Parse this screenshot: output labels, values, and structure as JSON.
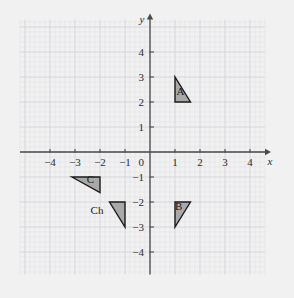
{
  "figure": {
    "type": "coordinate-plane",
    "background_color": "#f1f1f1",
    "grid_color_minor": "#e3e3e8",
    "grid_color_major": "#d2d2da",
    "axis_color": "#4a4a4a",
    "shape_fill": "#a9a9a9",
    "shape_stroke": "#1c1c1c"
  },
  "axes": {
    "x_axis_name": "x",
    "y_axis_name": "y",
    "origin_label": "0",
    "x_ticks": [
      {
        "value": -4,
        "label": "−4"
      },
      {
        "value": -3,
        "label": "−3"
      },
      {
        "value": -2,
        "label": "−2"
      },
      {
        "value": -1,
        "label": "−1"
      },
      {
        "value": 1,
        "label": "1"
      },
      {
        "value": 2,
        "label": "2"
      },
      {
        "value": 3,
        "label": "3"
      },
      {
        "value": 4,
        "label": "4"
      }
    ],
    "y_ticks": [
      {
        "value": 4,
        "label": "4"
      },
      {
        "value": 3,
        "label": "3"
      },
      {
        "value": 2,
        "label": "2"
      },
      {
        "value": 1,
        "label": "1"
      },
      {
        "value": -1,
        "label": "−1"
      },
      {
        "value": -2,
        "label": "−2"
      },
      {
        "value": -3,
        "label": "−3"
      },
      {
        "value": -4,
        "label": "−4"
      }
    ],
    "x_range": [
      -5.2,
      4.6
    ],
    "y_range": [
      -4.9,
      5.3
    ],
    "minor_grid_per_unit": 5
  },
  "shapes": [
    {
      "id": "triangle-a",
      "label": "A",
      "label_position": {
        "x": 1.22,
        "y": 2.28
      },
      "vertices": [
        [
          1,
          3
        ],
        [
          1,
          2
        ],
        [
          1.62,
          2
        ]
      ]
    },
    {
      "id": "triangle-b",
      "label": "B",
      "label_position": {
        "x": 1.15,
        "y": -2.3
      },
      "vertices": [
        [
          1,
          -2
        ],
        [
          1.62,
          -2
        ],
        [
          1,
          -3
        ]
      ]
    },
    {
      "id": "triangle-c",
      "label": "C",
      "label_position": {
        "x": -2.38,
        "y": -1.22
      },
      "vertices": [
        [
          -3.12,
          -1
        ],
        [
          -2,
          -1
        ],
        [
          -2,
          -1.62
        ]
      ]
    },
    {
      "id": "triangle-ch",
      "label": "",
      "label_position": {
        "x": 0,
        "y": 0
      },
      "vertices": [
        [
          -1.62,
          -2
        ],
        [
          -1,
          -2
        ],
        [
          -1,
          -3
        ]
      ]
    }
  ],
  "annotations": [
    {
      "id": "ch-label",
      "text": "Ch",
      "position": {
        "x": -2.12,
        "y": -2.48
      }
    }
  ]
}
